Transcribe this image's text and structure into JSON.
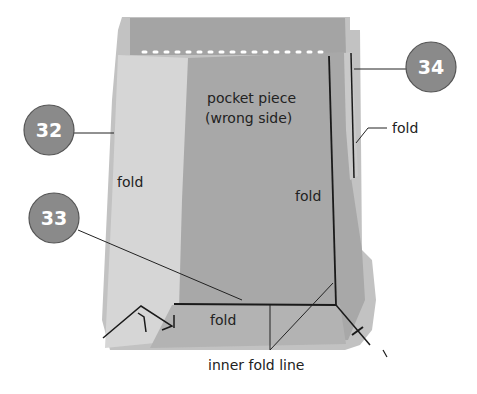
{
  "diagram": {
    "type": "sewing-instruction",
    "colors": {
      "background": "#ffffff",
      "fabric_outer": "#bdbdbd",
      "fabric_light_left": "#d4d4d4",
      "pocket_piece": "#a9a9a9",
      "line": "#1a1a1a",
      "badge_fill": "#8a8a8a",
      "badge_border": "#555555",
      "badge_text": "#ffffff"
    },
    "labels": {
      "pocket_title_line1": "pocket piece",
      "pocket_title_line2": "(wrong side)",
      "fold_left": "fold",
      "fold_right_vertical": "fold",
      "fold_right_pointer": "fold",
      "fold_bottom": "fold",
      "inner_fold_line": "inner fold line"
    },
    "badges": [
      {
        "number": "32"
      },
      {
        "number": "33"
      },
      {
        "number": "34"
      }
    ]
  }
}
